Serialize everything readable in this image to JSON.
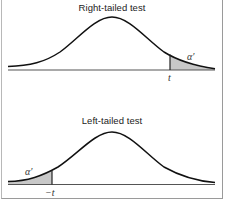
{
  "figure": {
    "panels": [
      {
        "title": "Right-tailed test",
        "tail": "right",
        "critical_label": "t",
        "area_label": "α′"
      },
      {
        "title": "Left-tailed test",
        "tail": "left",
        "critical_label": "−t",
        "area_label": "α′"
      }
    ],
    "colors": {
      "curve": "#111111",
      "baseline": "#555555",
      "shaded_area": "#c8c8c8",
      "frame": "#9a9a9a"
    }
  }
}
